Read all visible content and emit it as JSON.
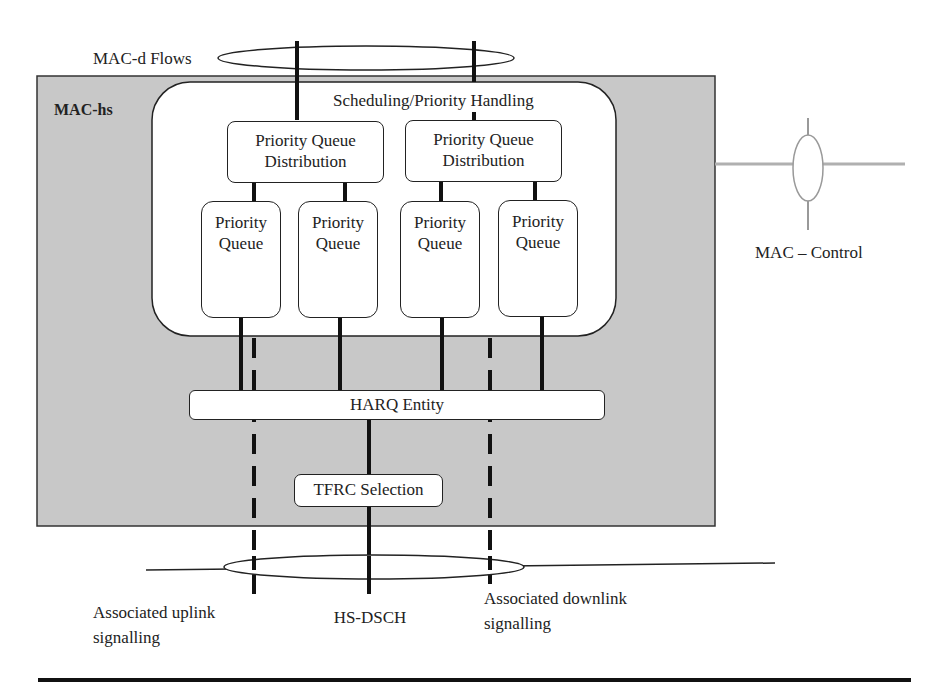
{
  "diagram": {
    "title": "MAC-hs",
    "mac_d_flows_label": "MAC-d Flows",
    "scheduling_label": "Scheduling/Priority Handling",
    "pqd": [
      {
        "line1": "Priority Queue",
        "line2": "Distribution"
      },
      {
        "line1": "Priority Queue",
        "line2": "Distribution"
      }
    ],
    "priority_queues": [
      {
        "line1": "Priority",
        "line2": "Queue"
      },
      {
        "line1": "Priority",
        "line2": "Queue"
      },
      {
        "line1": "Priority",
        "line2": "Queue"
      },
      {
        "line1": "Priority",
        "line2": "Queue"
      }
    ],
    "harq_label": "HARQ Entity",
    "tfrc_label": "TFRC Selection",
    "mac_control_label": "MAC – Control",
    "bottom_labels": {
      "uplink_line1": "Associated uplink",
      "uplink_line2": "signalling",
      "hsdsch": "HS-DSCH",
      "downlink_line1": "Associated downlink",
      "downlink_line2": "signalling"
    },
    "colors": {
      "mac_hs_fill": "#c8c8c8",
      "line": "#111111",
      "control_line": "#b0b0b0"
    }
  }
}
